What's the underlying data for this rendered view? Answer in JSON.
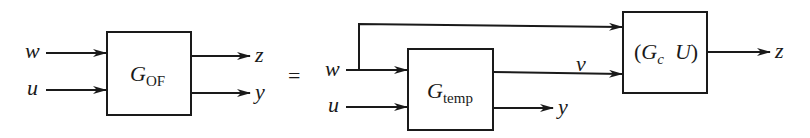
{
  "left_diagram": {
    "block": {
      "symbol": "G",
      "subscript": "OF"
    },
    "inputs": [
      "w",
      "u"
    ],
    "outputs": [
      "z",
      "y"
    ]
  },
  "equals": "=",
  "right_diagram": {
    "block_temp": {
      "symbol": "G",
      "subscript": "temp"
    },
    "block_c": {
      "open": "(",
      "symbol": "G",
      "subscript": "c",
      "symbol2": "U",
      "close": ")"
    },
    "inputs": [
      "w",
      "u"
    ],
    "internal_signal": "v",
    "outputs": [
      "z",
      "y"
    ]
  }
}
